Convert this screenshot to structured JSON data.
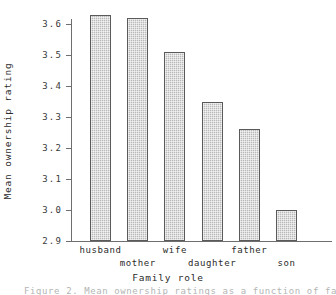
{
  "chart_data": {
    "type": "bar",
    "title": "",
    "xlabel": "Family role",
    "ylabel": "Mean ownership rating",
    "categories": [
      "husband",
      "mother",
      "wife",
      "daughter",
      "father",
      "son"
    ],
    "values": [
      3.63,
      3.62,
      3.51,
      3.35,
      3.26,
      3.0
    ],
    "ylim": [
      2.9,
      3.6
    ],
    "yticks": [
      "2.9",
      "3.0",
      "3.1",
      "3.2",
      "3.3",
      "3.4",
      "3.5",
      "3.6"
    ],
    "ytick_values": [
      2.9,
      3.0,
      3.1,
      3.2,
      3.3,
      3.4,
      3.5,
      3.6
    ],
    "grid": false,
    "legend": "none",
    "bar_color": "#b9b9b9",
    "bar_edge_color": "#5a5a5a",
    "axis_color": "#6e6e6e",
    "xtick_label_rows": [
      0,
      1,
      0,
      1,
      0,
      1
    ]
  },
  "caption": {
    "clipped_line": "Figure 2. Mean ownership ratings as a function of family role"
  }
}
